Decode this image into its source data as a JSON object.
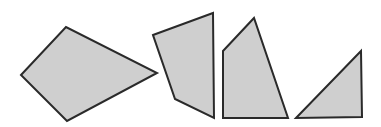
{
  "diagram": {
    "width": 381,
    "height": 127,
    "background": "#ffffff",
    "fill_color": "#cfcfcf",
    "stroke_color": "#2a2a2a",
    "shapes": [
      {
        "name": "quadrilateral-kite",
        "points": "21,75 66,27 157,73 67,121"
      },
      {
        "name": "quadrilateral-irregular-1",
        "points": "153,35 213,13 214,118 175,99"
      },
      {
        "name": "quadrilateral-irregular-2",
        "points": "223,51 254,18 288,118 223,118"
      },
      {
        "name": "right-triangle",
        "points": "296,118 361,51 362,117"
      }
    ]
  }
}
